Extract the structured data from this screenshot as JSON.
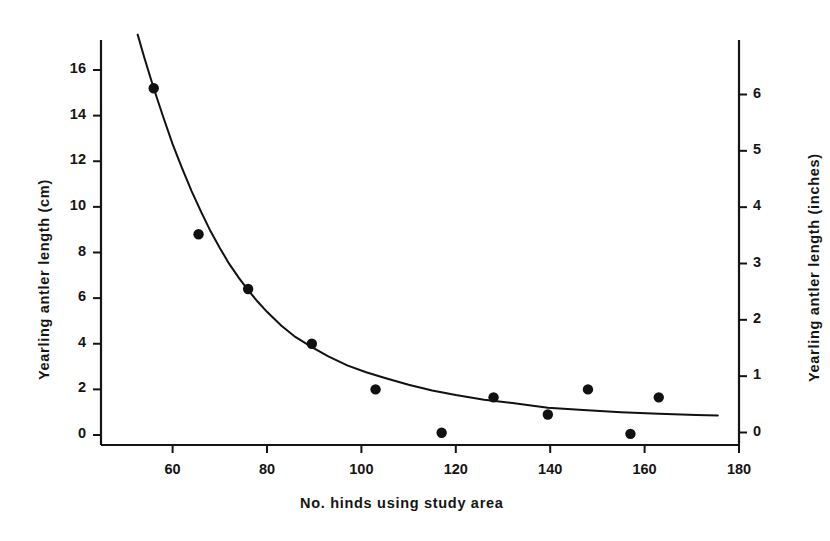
{
  "figure": {
    "background_color": "#ffffff",
    "ink_color": "#141414",
    "width": 830,
    "height": 541
  },
  "chart_data": {
    "type": "scatter",
    "title": "",
    "subtitle": "",
    "xlabel": "No. hinds using study area",
    "ylabel": "Yearling antler length (cm)",
    "ylabel_secondary": "Yearling antler length (inches)",
    "grid": false,
    "legend": false,
    "legend_position": "none",
    "xlim": [
      49,
      180
    ],
    "ylim": [
      0,
      17.6
    ],
    "ylim_secondary": [
      0,
      6.93
    ],
    "xticks": [
      60,
      80,
      100,
      120,
      140,
      160,
      180
    ],
    "xticklabels": [
      "60",
      "80",
      "100",
      "120",
      "140",
      "160",
      "180"
    ],
    "yticks": [
      0,
      2,
      4,
      6,
      8,
      10,
      12,
      14,
      16
    ],
    "yticklabels": [
      "0",
      "2",
      "4",
      "6",
      "8",
      "10",
      "12",
      "14",
      "16"
    ],
    "yticks_secondary": [
      0,
      1,
      2,
      3,
      4,
      5,
      6
    ],
    "yticklabels_secondary": [
      "0",
      "1",
      "2",
      "3",
      "4",
      "5",
      "6"
    ],
    "marker": "filled-circle",
    "marker_color": "#111111",
    "points": [
      {
        "x": 56,
        "y": 15.2
      },
      {
        "x": 65.5,
        "y": 8.8
      },
      {
        "x": 76,
        "y": 6.4
      },
      {
        "x": 89.5,
        "y": 4.0
      },
      {
        "x": 103,
        "y": 2.0
      },
      {
        "x": 117,
        "y": 0.1
      },
      {
        "x": 128,
        "y": 1.65
      },
      {
        "x": 139.5,
        "y": 0.9
      },
      {
        "x": 148,
        "y": 2.0
      },
      {
        "x": 157,
        "y": 0.05
      },
      {
        "x": 163,
        "y": 1.65
      }
    ],
    "fitted_curve": {
      "description": "exponential decay fit",
      "line_color": "#111111",
      "points": [
        {
          "x": 52.6,
          "y": 17.55
        },
        {
          "x": 54,
          "y": 16.55
        },
        {
          "x": 56,
          "y": 15.2
        },
        {
          "x": 58,
          "y": 13.95
        },
        {
          "x": 60,
          "y": 12.75
        },
        {
          "x": 62,
          "y": 11.7
        },
        {
          "x": 64,
          "y": 10.7
        },
        {
          "x": 66,
          "y": 9.8
        },
        {
          "x": 68,
          "y": 8.95
        },
        {
          "x": 70,
          "y": 8.2
        },
        {
          "x": 72,
          "y": 7.5
        },
        {
          "x": 74,
          "y": 6.9
        },
        {
          "x": 76,
          "y": 6.35
        },
        {
          "x": 78,
          "y": 5.85
        },
        {
          "x": 80,
          "y": 5.4
        },
        {
          "x": 83,
          "y": 4.8
        },
        {
          "x": 86,
          "y": 4.3
        },
        {
          "x": 89.5,
          "y": 3.85
        },
        {
          "x": 93,
          "y": 3.45
        },
        {
          "x": 97,
          "y": 3.05
        },
        {
          "x": 101,
          "y": 2.75
        },
        {
          "x": 105,
          "y": 2.5
        },
        {
          "x": 110,
          "y": 2.2
        },
        {
          "x": 115,
          "y": 1.95
        },
        {
          "x": 120,
          "y": 1.75
        },
        {
          "x": 126,
          "y": 1.55
        },
        {
          "x": 132,
          "y": 1.4
        },
        {
          "x": 139.5,
          "y": 1.2
        },
        {
          "x": 147,
          "y": 1.1
        },
        {
          "x": 155,
          "y": 1.0
        },
        {
          "x": 163,
          "y": 0.93
        },
        {
          "x": 171,
          "y": 0.88
        },
        {
          "x": 175.5,
          "y": 0.86
        }
      ]
    }
  }
}
